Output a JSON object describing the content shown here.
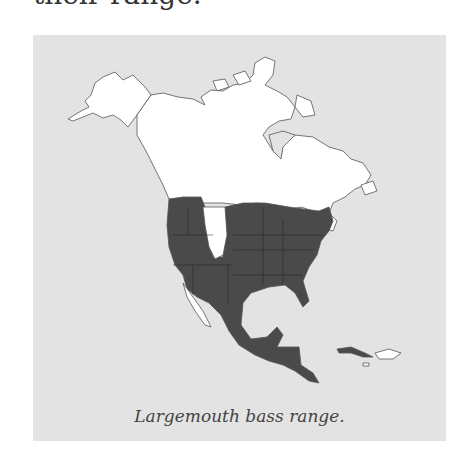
{
  "document": {
    "preceding_text": "their range."
  },
  "figure": {
    "caption": "Largemouth bass range.",
    "map": {
      "region": "North America",
      "legend": {
        "range_color": "#4a4a4a",
        "non_range_color": "#ffffff",
        "water_color": "#e3e3e3",
        "border_color": "#555555"
      },
      "range_description": "Southern Canada border, contiguous United States (excluding northern Great Plains/Rockies gap and Baja), Mexico, Central America, Cuba"
    }
  }
}
